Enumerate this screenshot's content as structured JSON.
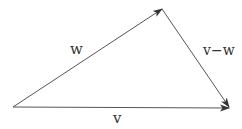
{
  "diagram": {
    "color": "#3a3a3a",
    "vectors": [
      {
        "name": "w",
        "label": "w",
        "from": [
          13,
          107
        ],
        "to": [
          162,
          9
        ]
      },
      {
        "name": "v",
        "label": "v",
        "from": [
          13,
          107
        ],
        "to": [
          229,
          108
        ]
      },
      {
        "name": "v-w",
        "label": "v−w",
        "from": [
          162,
          9
        ],
        "to": [
          229,
          107
        ]
      }
    ]
  }
}
